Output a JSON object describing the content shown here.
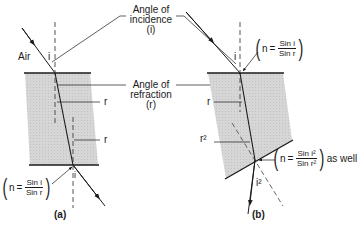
{
  "figure": {
    "panel_a": {
      "caption": "(a)",
      "medium_label": "Air",
      "incidence_symbol": "i",
      "refraction_symbol_1": "r",
      "refraction_symbol_2": "r",
      "exit_symbol": "i",
      "formula": {
        "lhs": "n",
        "eq": "=",
        "numerator": "Sin i",
        "denominator": "Sin r"
      }
    },
    "panel_b": {
      "caption": "(b)",
      "incidence_symbol": "i",
      "refraction_symbol": "r",
      "refraction_symbol_2": "r²",
      "exit_symbol": "i²",
      "formula_top": {
        "lhs": "n",
        "eq": "=",
        "numerator": "Sin i",
        "denominator": "Sin r"
      },
      "formula_bottom": {
        "lhs": "n",
        "eq": "=",
        "numerator": "Sin i²",
        "denominator": "Sin r²",
        "suffix": "as well"
      }
    },
    "callouts": {
      "incidence_line1": "Angle of",
      "incidence_line2": "incidence",
      "incidence_line3": "(i)",
      "refraction_line1": "Angle of",
      "refraction_line2": "refraction",
      "refraction_line3": "(r)"
    },
    "colors": {
      "glass_fill": "#d4d4d4",
      "line": "#1a1a1a",
      "background": "#ffffff"
    }
  }
}
